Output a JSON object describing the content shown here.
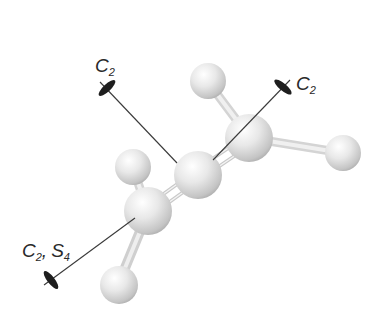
{
  "diagram": {
    "labels": {
      "axis_upper_left": {
        "main": "C",
        "sub": "2"
      },
      "axis_upper_right": {
        "main": "C",
        "sub": "2"
      },
      "axis_lower_left": {
        "main1": "C",
        "sub1": "2",
        "sep": ",",
        "main2": "S",
        "sub2": "4"
      }
    },
    "colors": {
      "atom_light": "#ffffff",
      "atom_mid": "#e2e2e2",
      "atom_dark": "#a8a8a8",
      "axis_line": "#3a3a3a",
      "axis_marker": "#1e1e1e",
      "label": "#2a2a2a"
    }
  }
}
